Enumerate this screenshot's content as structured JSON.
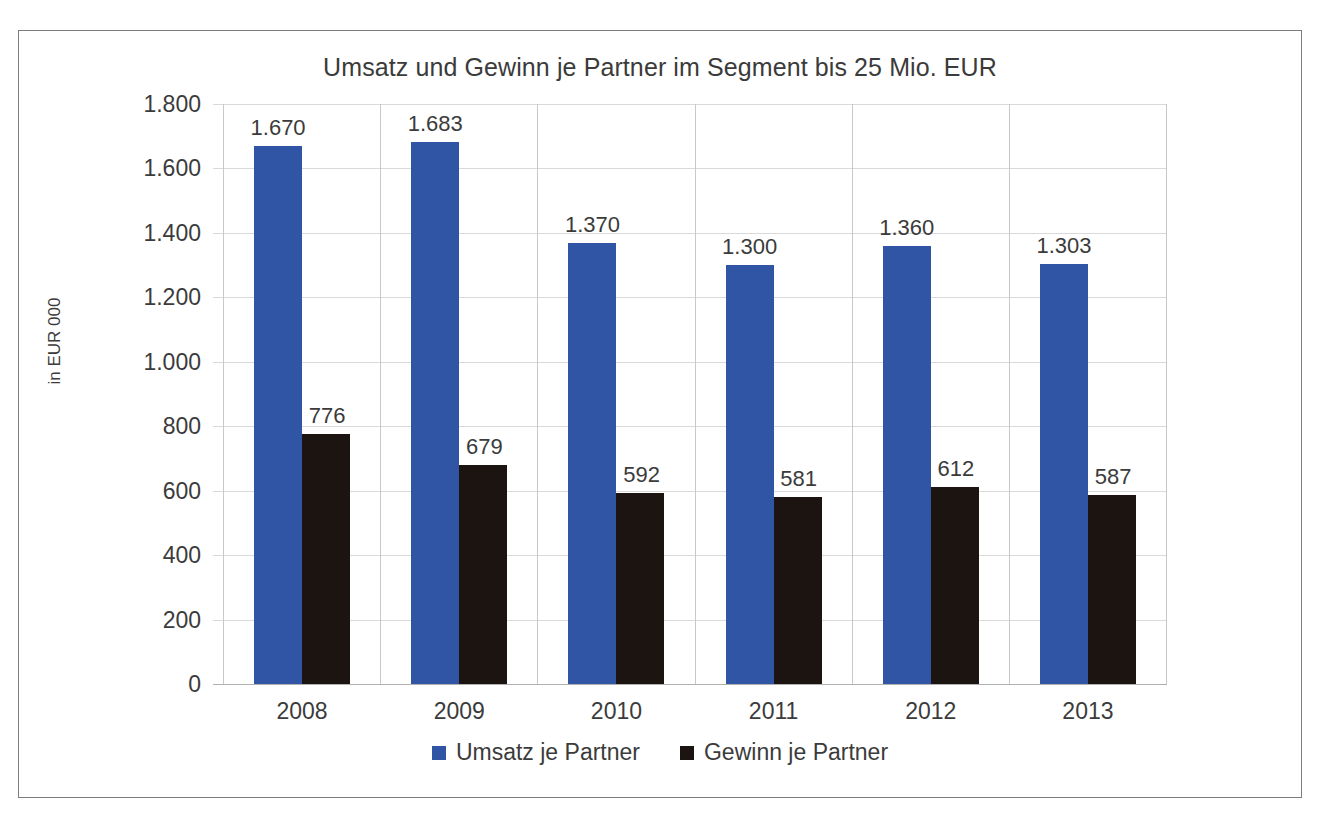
{
  "chart_data": {
    "type": "bar",
    "title": "Umsatz und Gewinn je Partner im Segment bis 25 Mio. EUR",
    "xlabel": "",
    "ylabel": "in EUR 000",
    "ylim": [
      0,
      1800
    ],
    "ytick_step": 200,
    "grid": true,
    "legend_position": "bottom",
    "categories": [
      "2008",
      "2009",
      "2010",
      "2011",
      "2012",
      "2013"
    ],
    "ytick_labels": [
      "1.800",
      "1.600",
      "1.400",
      "1.200",
      "1.000",
      "800",
      "600",
      "400",
      "200",
      "0"
    ],
    "ytick_values": [
      1800,
      1600,
      1400,
      1200,
      1000,
      800,
      600,
      400,
      200,
      0
    ],
    "series": [
      {
        "name": "Umsatz je Partner",
        "color": "#2f55a4",
        "values": [
          1670,
          1683,
          1370,
          1300,
          1360,
          1303
        ],
        "labels": [
          "1.670",
          "1.683",
          "1.370",
          "1.300",
          "1.360",
          "1.303"
        ]
      },
      {
        "name": "Gewinn je Partner",
        "color": "#1c1410",
        "values": [
          776,
          679,
          592,
          581,
          612,
          587
        ],
        "labels": [
          "776",
          "679",
          "592",
          "581",
          "612",
          "587"
        ]
      }
    ]
  },
  "legend": {
    "items": [
      {
        "label": "Umsatz je Partner",
        "color": "#2f55a4"
      },
      {
        "label": "Gewinn je Partner",
        "color": "#1c1410"
      }
    ]
  }
}
